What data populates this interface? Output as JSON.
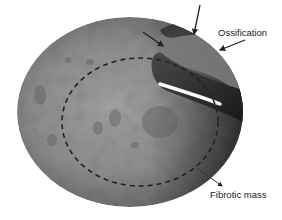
{
  "figure": {
    "type": "endoscopic-image",
    "annotations": {
      "ossification_label": "Ossification",
      "fibrotic_label": "Fibrotic mass"
    },
    "colors": {
      "background": "#ffffff",
      "tissue_light": "#9a9a9a",
      "tissue_mid": "#7c7c7c",
      "tissue_dark": "#3a3a3a",
      "instrument_dark": "#1e1e1e",
      "instrument_highlight": "#f4f4f4",
      "dashed_outline": "#222222",
      "arrow": "#222222",
      "label_text": "#1a1a1a"
    },
    "arrows": [
      {
        "name": "ossification-arrow-top",
        "from": [
          200,
          5
        ],
        "to": [
          194,
          34
        ]
      },
      {
        "name": "ossification-arrow-left",
        "from": [
          143,
          32
        ],
        "to": [
          163,
          46
        ]
      },
      {
        "name": "ossification-arrow-right",
        "from": [
          245,
          40
        ],
        "to": [
          220,
          50
        ]
      },
      {
        "name": "fibrotic-arrow",
        "from": [
          197,
          168
        ],
        "to": [
          222,
          186
        ]
      }
    ]
  }
}
